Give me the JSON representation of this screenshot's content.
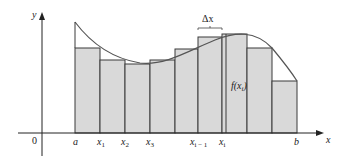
{
  "diagram": {
    "axes": {
      "x_label": "x",
      "y_label": "y",
      "origin_label": "0"
    },
    "tick_labels": [
      {
        "id": "a",
        "text": "a",
        "sub": "",
        "x": 75
      },
      {
        "id": "x1",
        "text": "x",
        "sub": "1",
        "x": 100
      },
      {
        "id": "x2",
        "text": "x",
        "sub": "2",
        "x": 125
      },
      {
        "id": "x3",
        "text": "x",
        "sub": "3",
        "x": 150
      },
      {
        "id": "xim1",
        "text": "x",
        "sub": "i − 1",
        "x": 198
      },
      {
        "id": "xi",
        "text": "x",
        "sub": "i",
        "x": 222
      },
      {
        "id": "b",
        "text": "b",
        "sub": "",
        "x": 297
      }
    ],
    "annotations": {
      "delta_x": "Δx",
      "f_label": "f(x",
      "f_label_sub": "i",
      "f_label_close": ")"
    },
    "colors": {
      "fill": "#d9d9d9",
      "stroke": "#3a3a3a",
      "curve": "#555555"
    }
  }
}
